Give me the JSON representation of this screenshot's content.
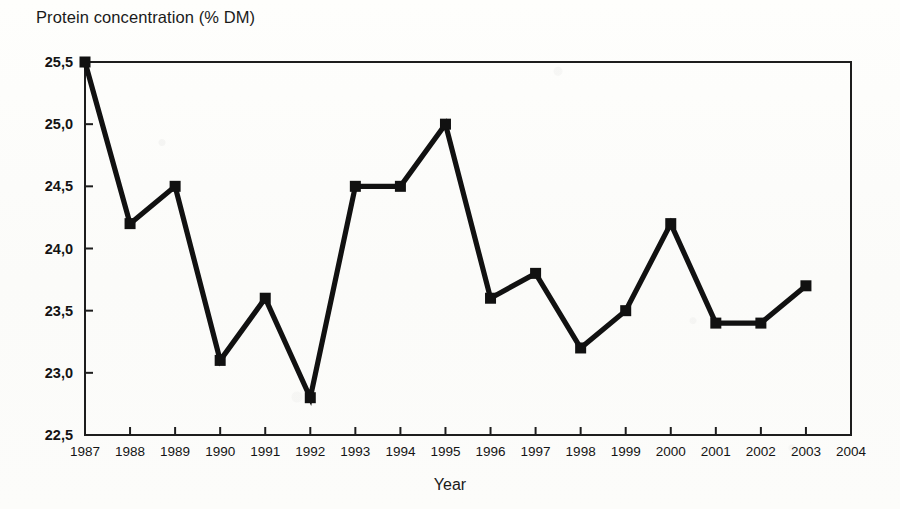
{
  "figure": {
    "y_axis_title": "Protein concentration (% DM)",
    "x_axis_title": "Year"
  },
  "chart_data": {
    "type": "line",
    "title": "",
    "xlabel": "Year",
    "ylabel": "Protein concentration (% DM)",
    "categories": [
      1987,
      1988,
      1989,
      1990,
      1991,
      1992,
      1993,
      1994,
      1995,
      1996,
      1997,
      1998,
      1999,
      2000,
      2001,
      2002,
      2003
    ],
    "values": [
      25.5,
      24.2,
      24.5,
      23.1,
      23.6,
      22.8,
      24.5,
      24.5,
      25.0,
      23.6,
      23.8,
      23.2,
      23.5,
      24.2,
      23.4,
      23.4,
      23.7
    ],
    "series": [
      {
        "name": "Protein concentration (% DM)",
        "values": [
          25.5,
          24.2,
          24.5,
          23.1,
          23.6,
          22.8,
          24.5,
          24.5,
          25.0,
          23.6,
          23.8,
          23.2,
          23.5,
          24.2,
          23.4,
          23.4,
          23.7
        ],
        "marker": "square",
        "color": "#111111"
      }
    ],
    "ylim": [
      22.5,
      25.5
    ],
    "xlim": [
      1987,
      2004
    ],
    "ytick_labels": [
      "22,5",
      "23,0",
      "23,5",
      "24,0",
      "24,5",
      "25,0",
      "25,5"
    ],
    "ytick_values": [
      22.5,
      23.0,
      23.5,
      24.0,
      24.5,
      25.0,
      25.5
    ],
    "xtick_labels": [
      "1987",
      "1988",
      "1989",
      "1990",
      "1991",
      "1992",
      "1993",
      "1994",
      "1995",
      "1996",
      "1997",
      "1998",
      "1999",
      "2000",
      "2001",
      "2002",
      "2003",
      "2004"
    ],
    "xtick_values": [
      1987,
      1988,
      1989,
      1990,
      1991,
      1992,
      1993,
      1994,
      1995,
      1996,
      1997,
      1998,
      1999,
      2000,
      2001,
      2002,
      2003,
      2004
    ],
    "grid": false,
    "legend": false,
    "decimal_separator": ",",
    "line_color": "#111111",
    "axis_color": "#1d1d1d",
    "background_color": "#fdfdfb"
  }
}
